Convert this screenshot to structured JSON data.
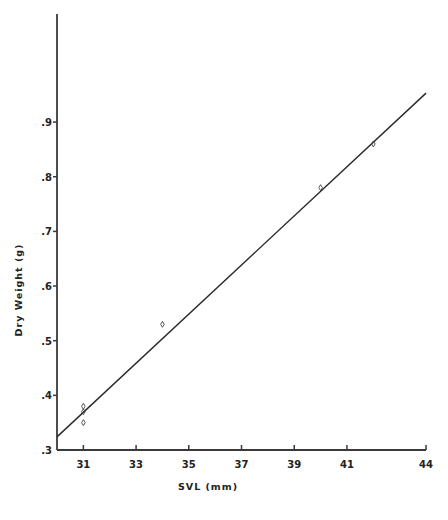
{
  "chart_data": {
    "type": "scatter",
    "title": "",
    "xlabel": "SVL (mm)",
    "ylabel": "Dry Weight (g)",
    "xlim": [
      30,
      44
    ],
    "ylim": [
      0.3,
      1.0
    ],
    "x_ticks": [
      31,
      33,
      35,
      37,
      39,
      41,
      44
    ],
    "x_tick_labels": [
      "31",
      "33",
      "35",
      "37",
      "39",
      "41",
      "44"
    ],
    "y_ticks": [
      0.3,
      0.4,
      0.5,
      0.6,
      0.7,
      0.8,
      0.9
    ],
    "y_tick_labels": [
      ".3",
      ".4",
      ".5",
      ".6",
      ".7",
      ".8",
      ".9"
    ],
    "grid": false,
    "legend": null,
    "series": [
      {
        "name": "observations",
        "marker": "diamond-open",
        "points": [
          {
            "x": 31,
            "y": 0.38
          },
          {
            "x": 31,
            "y": 0.37
          },
          {
            "x": 31,
            "y": 0.35
          },
          {
            "x": 34,
            "y": 0.53
          },
          {
            "x": 40,
            "y": 0.78
          },
          {
            "x": 42,
            "y": 0.86
          }
        ]
      },
      {
        "name": "regression line",
        "type": "line",
        "points": [
          {
            "x": 30,
            "y": 0.324
          },
          {
            "x": 44,
            "y": 0.953
          }
        ]
      }
    ]
  },
  "layout": {
    "plot": {
      "x0": 57,
      "x1": 426,
      "y_top": 14,
      "y_bottom": 450
    },
    "x_map": {
      "v0": 30,
      "px0": 57,
      "px_per_unit": 26.36
    },
    "y_map": {
      "v0": 0.3,
      "px0": 450,
      "px_per_unit": 546.5
    },
    "colors": {
      "axis": "#3a3a3a",
      "line": "#2a2a2a",
      "marker": "#444444",
      "text": "#222222"
    }
  }
}
